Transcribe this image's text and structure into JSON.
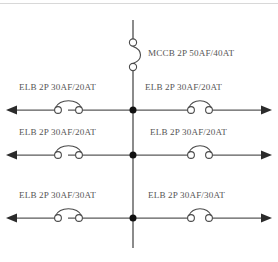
{
  "diagram": {
    "type": "electrical-single-line-diagram",
    "background_color": "#ffffff",
    "line_color": "#5a5a5a",
    "text_color": "#555555",
    "node_color": "#111111",
    "width": 278,
    "height": 262
  },
  "main_breaker": {
    "symbol": "mccb-symbol",
    "label": "MCCB  2P  50AF/40AT",
    "device": "MCCB",
    "poles": "2P",
    "frame_rating": "50AF",
    "trip_rating": "40AT"
  },
  "bus": {
    "name": "vertical-bus",
    "orientation": "vertical"
  },
  "feeders": [
    {
      "row": 1,
      "left": {
        "label": "ELB  2P  30AF/20AT",
        "device": "ELB",
        "poles": "2P",
        "frame_rating": "30AF",
        "trip_rating": "20AT",
        "direction": "left"
      },
      "right": {
        "label": "ELB  2P  30AF/20AT",
        "device": "ELB",
        "poles": "2P",
        "frame_rating": "30AF",
        "trip_rating": "20AT",
        "direction": "right"
      }
    },
    {
      "row": 2,
      "left": {
        "label": "ELB  2P  30AF/20AT",
        "device": "ELB",
        "poles": "2P",
        "frame_rating": "30AF",
        "trip_rating": "20AT",
        "direction": "left"
      },
      "right": {
        "label": "ELB  2P  30AF/20AT",
        "device": "ELB",
        "poles": "2P",
        "frame_rating": "30AF",
        "trip_rating": "20AT",
        "direction": "right"
      }
    },
    {
      "row": 3,
      "left": {
        "label": "ELB  2P  30AF/30AT",
        "device": "ELB",
        "poles": "2P",
        "frame_rating": "30AF",
        "trip_rating": "30AT",
        "direction": "left"
      },
      "right": {
        "label": "ELB  2P  30AF/30AT",
        "device": "ELB",
        "poles": "2P",
        "frame_rating": "30AF",
        "trip_rating": "30AT",
        "direction": "right"
      }
    }
  ]
}
